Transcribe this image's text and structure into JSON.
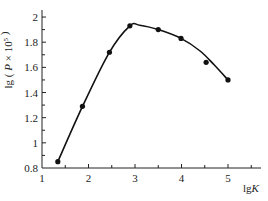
{
  "chart_data": {
    "type": "line",
    "title": "",
    "xlabel": "lgK",
    "ylabel": "lg ( P × 10⁵ )",
    "xlim": [
      1,
      5.6
    ],
    "ylim": [
      0.8,
      2.05
    ],
    "x_ticks": [
      1,
      2,
      3,
      4,
      5
    ],
    "x_tick_labels": [
      "1",
      "2",
      "3",
      "4",
      "5"
    ],
    "x_minor_ticks": [
      1.5,
      2.5,
      3.5,
      4.5,
      5.5
    ],
    "y_ticks": [
      0.8,
      1.0,
      1.2,
      1.4,
      1.6,
      1.8,
      2.0
    ],
    "y_tick_labels": [
      "0.8",
      "1",
      "1.2",
      "1.4",
      "1.6",
      "1.8",
      "2"
    ],
    "y_minor_ticks": [
      0.9,
      1.1,
      1.3,
      1.5,
      1.7,
      1.9
    ],
    "grid": false,
    "legend": null,
    "series": [
      {
        "name": "measured",
        "style": "markers",
        "x": [
          1.34,
          1.87,
          2.45,
          2.89,
          3.5,
          3.99,
          4.53,
          5.0
        ],
        "y": [
          0.85,
          1.29,
          1.72,
          1.93,
          1.9,
          1.83,
          1.64,
          1.5
        ]
      },
      {
        "name": "fitted curve",
        "style": "line",
        "x": [
          1.34,
          1.87,
          2.45,
          2.89,
          3.1,
          3.5,
          3.99,
          4.4,
          4.7,
          5.0
        ],
        "y": [
          0.85,
          1.29,
          1.72,
          1.93,
          1.935,
          1.9,
          1.83,
          1.73,
          1.62,
          1.5
        ]
      }
    ]
  }
}
